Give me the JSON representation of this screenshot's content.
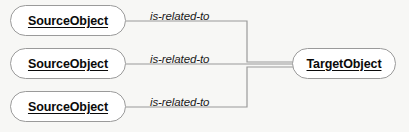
{
  "diagram": {
    "background_color": "#f7f7f5",
    "node_fill_color": "#ffffff",
    "node_stroke_color": "#9a9a9a",
    "edge_stroke_color": "#9a9a9a",
    "label_text_color": "#0a0a0a",
    "source_nodes": [
      {
        "id": "source-1",
        "label": "SourceObject"
      },
      {
        "id": "source-2",
        "label": "SourceObject"
      },
      {
        "id": "source-3",
        "label": "SourceObject"
      }
    ],
    "target_node": {
      "id": "target-1",
      "label": "TargetObject"
    },
    "edges": [
      {
        "id": "edge-1",
        "from": "source-1",
        "to": "target-1",
        "label": "is-related-to"
      },
      {
        "id": "edge-2",
        "from": "source-2",
        "to": "target-1",
        "label": "is-related-to"
      },
      {
        "id": "edge-3",
        "from": "source-3",
        "to": "target-1",
        "label": "is-related-to"
      }
    ]
  }
}
